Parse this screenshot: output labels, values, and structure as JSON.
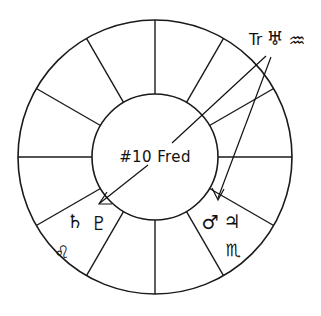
{
  "diagram": {
    "type": "astrological-chart-wheel",
    "title_center": "#10 Fred",
    "house_count": 12,
    "geometry": {
      "center_x": 155,
      "center_y": 157,
      "outer_radius": 137,
      "inner_radius": 63
    },
    "annotations": {
      "transit": {
        "prefix": "Tr",
        "planet_glyph": "♅",
        "planet_name": "uranus",
        "sign_glyph": "♒",
        "sign_name": "aquarius",
        "full_text": "Tr ♅ ♒"
      }
    },
    "placements": [
      {
        "id": "lower-left",
        "house_label": "natal-saturn-pluto",
        "glyphs": [
          {
            "glyph": "♄",
            "name": "saturn"
          },
          {
            "glyph": "♇",
            "name": "pluto"
          }
        ],
        "sign": {
          "glyph": "♌",
          "name": "leo"
        }
      },
      {
        "id": "lower-right",
        "house_label": "natal-mars-jupiter",
        "glyphs": [
          {
            "glyph": "♂",
            "name": "mars"
          },
          {
            "glyph": "♃",
            "name": "jupiter"
          }
        ],
        "sign": {
          "glyph": "♏",
          "name": "scorpio"
        }
      }
    ],
    "colors": {
      "stroke": "#1a1a1a",
      "text": "#111111",
      "background": "#ffffff"
    }
  }
}
